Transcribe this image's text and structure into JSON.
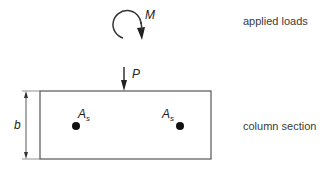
{
  "labels": {
    "applied_loads": "applied loads",
    "column_section": "column section"
  },
  "symbols": {
    "moment": "M",
    "axial_load": "P",
    "width": "b",
    "steel_area_base": "A",
    "steel_area_sub": "s"
  },
  "colors": {
    "line": "#555555",
    "text": "#3a3a3a",
    "rebar": "#111111"
  }
}
